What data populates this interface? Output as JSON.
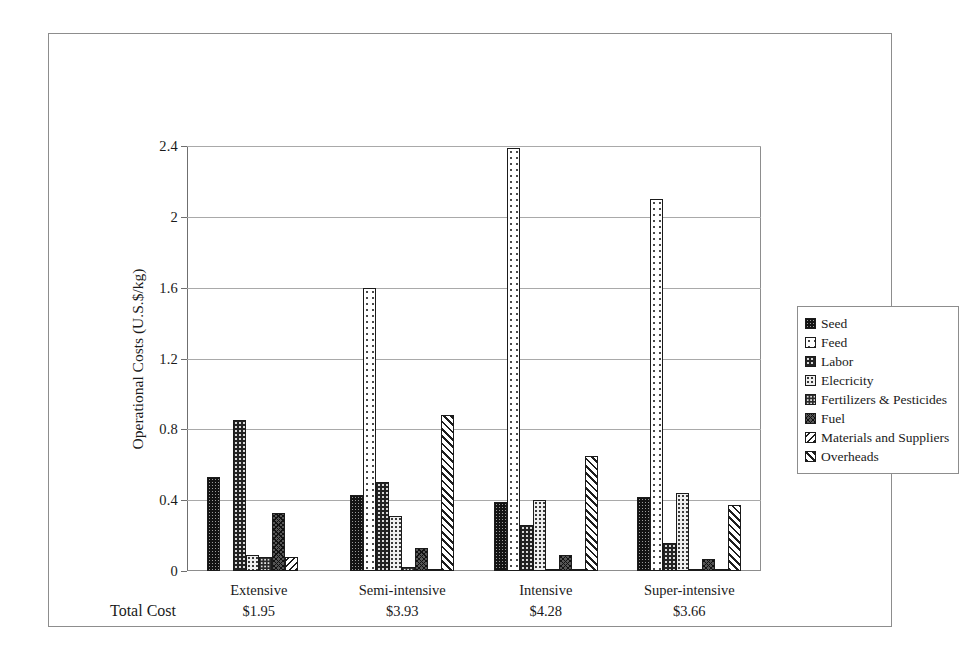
{
  "chart_data": {
    "type": "bar",
    "title": "",
    "xlabel": "",
    "ylabel": "Operational Costs (U.S.$/kg)",
    "ylim": [
      0,
      2.4
    ],
    "yticks": [
      "0",
      "0.4",
      "0.8",
      "1.2",
      "1.6",
      "2",
      "2.4"
    ],
    "ytick_values": [
      0,
      0.4,
      0.8,
      1.2,
      1.6,
      2.0,
      2.4
    ],
    "grid": true,
    "legend_position": "right",
    "categories": [
      "Extensive",
      "Semi-intensive",
      "Intensive",
      "Super-intensive"
    ],
    "total_cost_label": "Total Cost",
    "total_costs": [
      "$1.95",
      "$3.93",
      "$4.28",
      "$3.66"
    ],
    "series": [
      {
        "name": "Seed",
        "pattern": "p-seed",
        "values": [
          0.53,
          0.43,
          0.39,
          0.42
        ]
      },
      {
        "name": "Feed",
        "pattern": "p-feed",
        "values": [
          0.0,
          1.6,
          2.39,
          2.1
        ]
      },
      {
        "name": "Labor",
        "pattern": "p-labor",
        "values": [
          0.85,
          0.5,
          0.26,
          0.16
        ]
      },
      {
        "name": "Elecricity",
        "pattern": "p-elec",
        "values": [
          0.09,
          0.31,
          0.4,
          0.44
        ]
      },
      {
        "name": "Fertilizers & Pesticides",
        "pattern": "p-fert",
        "values": [
          0.08,
          0.02,
          0.01,
          0.01
        ]
      },
      {
        "name": "Fuel",
        "pattern": "p-fuel",
        "values": [
          0.33,
          0.13,
          0.09,
          0.07
        ]
      },
      {
        "name": "Materials and Suppliers",
        "pattern": "p-mat",
        "values": [
          0.08,
          0.01,
          0.01,
          0.01
        ]
      },
      {
        "name": "Overheads",
        "pattern": "p-over",
        "values": [
          0.0,
          0.88,
          0.65,
          0.37
        ]
      }
    ]
  },
  "legend": {
    "items": [
      {
        "label": "Seed",
        "pattern": "p-seed"
      },
      {
        "label": "Feed",
        "pattern": "p-feed"
      },
      {
        "label": "Labor",
        "pattern": "p-labor"
      },
      {
        "label": "Elecricity",
        "pattern": "p-elec"
      },
      {
        "label": "Fertilizers & Pesticides",
        "pattern": "p-fert"
      },
      {
        "label": "Fuel",
        "pattern": "p-fuel"
      },
      {
        "label": "Materials and Suppliers",
        "pattern": "p-mat"
      },
      {
        "label": "Overheads",
        "pattern": "p-over"
      }
    ]
  },
  "colors": {
    "frame": "#8d8d8d",
    "gridline": "#a9a9a9",
    "axis": "#6f6f6f",
    "text": "#1a1a1a",
    "background": "#ffffff"
  }
}
